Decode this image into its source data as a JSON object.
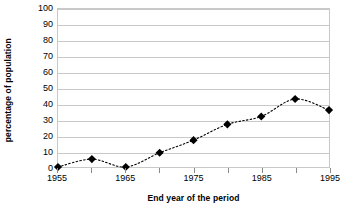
{
  "chart_data": {
    "type": "line",
    "title": "",
    "subtitle": "",
    "xlabel": "End year of the period",
    "ylabel": "percentage of population",
    "x": [
      1955,
      1960,
      1965,
      1970,
      1975,
      1980,
      1985,
      1990,
      1995
    ],
    "values": [
      0,
      5,
      0,
      9,
      17,
      27,
      32,
      43,
      36
    ],
    "series": [
      {
        "name": "percentage of population",
        "values": [
          0,
          5,
          0,
          9,
          17,
          27,
          32,
          43,
          36
        ]
      }
    ],
    "xlim": [
      1955,
      1995
    ],
    "ylim": [
      0,
      100
    ],
    "ytick_labels": [
      "100",
      "90",
      "80",
      "70",
      "60",
      "50",
      "40",
      "30",
      "20",
      "10",
      "0"
    ],
    "ytick_values": [
      100,
      90,
      80,
      70,
      60,
      50,
      40,
      30,
      20,
      10,
      0
    ],
    "xtick_labels": [
      "1955",
      "1965",
      "1975",
      "1985",
      "1995"
    ],
    "xtick_values": [
      1955,
      1965,
      1975,
      1985,
      1995
    ],
    "xtick_minor_values": [
      1960,
      1970,
      1980,
      1990
    ],
    "grid": "horizontal",
    "legend": "none",
    "marker": "diamond",
    "marker_color": "#000000",
    "line_style": "dotted",
    "line_color": "#000000",
    "plot_border_color": "#c8c8c8",
    "gridline_color": "#c8c8c8",
    "background_color": "#ffffff"
  }
}
